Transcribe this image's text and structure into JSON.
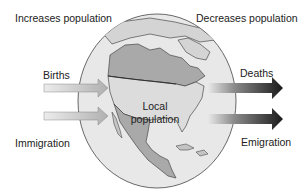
{
  "diagram": {
    "title_left": "Increases population",
    "title_right": "Decreases population",
    "center_label_line1": "Local",
    "center_label_line2": "population",
    "inflows": [
      {
        "label": "Births"
      },
      {
        "label": "Immigration"
      }
    ],
    "outflows": [
      {
        "label": "Deaths"
      },
      {
        "label": "Emigration"
      }
    ],
    "colors": {
      "ocean": "#e6e6e6",
      "land_light": "#d2d2d2",
      "land_dark": "#a9a9a9",
      "outline": "#333333",
      "inflow_arrow": "#b5b5b5",
      "outflow_arrow_dark": "#1e1e1e"
    }
  }
}
